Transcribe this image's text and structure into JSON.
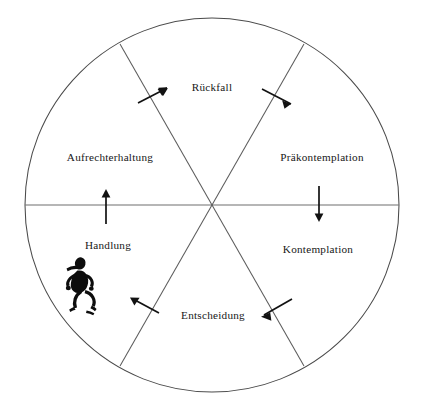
{
  "diagram": {
    "shape": "circle",
    "sector_count": 6,
    "colors": {
      "outline": "#4a4a4a",
      "divider": "#5c5c5c",
      "arrow": "#121212",
      "text": "#171717",
      "background": "#ffffff",
      "figure": "#0d0d0d"
    },
    "sectors": [
      {
        "id": "rueckfall",
        "label": "Rückfall",
        "position": "top"
      },
      {
        "id": "praekontemplation",
        "label": "Präkontemplation",
        "position": "upper-right"
      },
      {
        "id": "kontemplation",
        "label": "Kontemplation",
        "position": "lower-right"
      },
      {
        "id": "entscheidung",
        "label": "Entscheidung",
        "position": "bottom"
      },
      {
        "id": "handlung",
        "label": "Handlung",
        "position": "lower-left"
      },
      {
        "id": "aufrechterhaltung",
        "label": "Aufrechterhaltung",
        "position": "upper-left"
      }
    ],
    "arrows": [
      {
        "id": "arrow-aufrechterhaltung-to-rueckfall",
        "direction": "up-right",
        "crosses": "upper-left-divider"
      },
      {
        "id": "arrow-rueckfall-to-praekontemplation",
        "direction": "down-right",
        "crosses": "upper-right-divider"
      },
      {
        "id": "arrow-praekontemplation-to-kontemplation",
        "direction": "down",
        "crosses": "right-horizontal-divider"
      },
      {
        "id": "arrow-kontemplation-to-entscheidung",
        "direction": "down-left",
        "crosses": "lower-right-divider"
      },
      {
        "id": "arrow-entscheidung-to-handlung",
        "direction": "up-left",
        "crosses": "lower-left-divider"
      },
      {
        "id": "arrow-handlung-to-aufrechterhaltung",
        "direction": "up",
        "crosses": "left-horizontal-divider"
      }
    ],
    "icons": [
      {
        "id": "running-person-icon",
        "label": "running-person-icon",
        "sector": "handlung"
      }
    ]
  }
}
